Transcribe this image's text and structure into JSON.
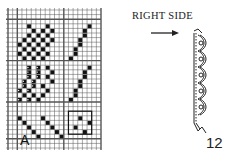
{
  "diagram": {
    "type": "weaving/knitting chart with edge illustration",
    "grid": {
      "origin_x": 8,
      "origin_y": 10,
      "cols": 20,
      "rows": 30,
      "cell_w": 4.65,
      "cell_h": 4.6,
      "line_color": "#555555",
      "heavy_cols": [
        2,
        12,
        20,
        0
      ],
      "heavy_rows": [
        2,
        11,
        20,
        28
      ],
      "filled_color": "#111111",
      "filled_cells": [
        [
          4,
          3
        ],
        [
          8,
          3
        ],
        [
          17,
          3
        ],
        [
          5,
          4
        ],
        [
          7,
          4
        ],
        [
          9,
          4
        ],
        [
          16,
          4
        ],
        [
          4,
          5
        ],
        [
          6,
          5
        ],
        [
          8,
          5
        ],
        [
          16,
          5
        ],
        [
          3,
          6
        ],
        [
          5,
          6
        ],
        [
          7,
          6
        ],
        [
          9,
          6
        ],
        [
          15,
          6
        ],
        [
          2,
          7
        ],
        [
          4,
          7
        ],
        [
          6,
          7
        ],
        [
          8,
          7
        ],
        [
          15,
          7
        ],
        [
          3,
          8
        ],
        [
          5,
          8
        ],
        [
          7,
          8
        ],
        [
          14,
          8
        ],
        [
          2,
          9
        ],
        [
          4,
          9
        ],
        [
          6,
          9
        ],
        [
          8,
          9
        ],
        [
          14,
          9
        ],
        [
          3,
          10
        ],
        [
          5,
          10
        ],
        [
          7,
          10
        ],
        [
          13,
          10
        ],
        [
          4,
          12
        ],
        [
          6,
          12
        ],
        [
          8,
          12
        ],
        [
          17,
          12
        ],
        [
          4,
          13
        ],
        [
          6,
          13
        ],
        [
          9,
          13
        ],
        [
          16,
          13
        ],
        [
          4,
          14
        ],
        [
          6,
          14
        ],
        [
          8,
          14
        ],
        [
          16,
          14
        ],
        [
          3,
          15
        ],
        [
          5,
          15
        ],
        [
          9,
          15
        ],
        [
          15,
          15
        ],
        [
          3,
          16
        ],
        [
          5,
          16
        ],
        [
          7,
          16
        ],
        [
          15,
          16
        ],
        [
          2,
          17
        ],
        [
          4,
          17
        ],
        [
          8,
          17
        ],
        [
          14,
          17
        ],
        [
          3,
          18
        ],
        [
          5,
          18
        ],
        [
          7,
          18
        ],
        [
          14,
          18
        ],
        [
          2,
          19
        ],
        [
          4,
          19
        ],
        [
          6,
          19
        ],
        [
          13,
          19
        ],
        [
          2,
          23
        ],
        [
          7,
          23
        ],
        [
          15,
          23
        ],
        [
          3,
          24
        ],
        [
          8,
          24
        ],
        [
          17,
          24
        ],
        [
          4,
          25
        ],
        [
          9,
          25
        ],
        [
          14,
          25
        ],
        [
          5,
          26
        ],
        [
          10,
          26
        ],
        [
          16,
          26
        ],
        [
          6,
          27
        ],
        [
          11,
          27
        ]
      ],
      "dotted_cells": [
        [
          4,
          12
        ],
        [
          4,
          13
        ],
        [
          4,
          14
        ],
        [
          6,
          12
        ],
        [
          6,
          13
        ],
        [
          6,
          14
        ],
        [
          3,
          15
        ],
        [
          3,
          16
        ],
        [
          2,
          17
        ],
        [
          2,
          19
        ],
        [
          5,
          15
        ],
        [
          5,
          16
        ],
        [
          4,
          17
        ],
        [
          4,
          19
        ]
      ],
      "box_motif": {
        "col": 13,
        "row": 22,
        "w": 5,
        "h": 5
      }
    },
    "labels": {
      "right_side": "RIGHT SIDE",
      "arrow": "→",
      "corner_letter": "A",
      "figure_number": "12"
    },
    "icons": {
      "arrow": "arrow-right-icon",
      "edge": "braided-edge-illustration"
    }
  }
}
